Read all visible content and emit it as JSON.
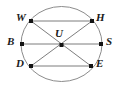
{
  "figure": {
    "type": "circle-geometry-diagram",
    "background_color": "#ffffff",
    "stroke_color": "#8c8c8c",
    "chord_color": "#6e6e6e",
    "point_color": "#141414",
    "label_color": "#1a1a1a",
    "circle": {
      "center_x": 61.5,
      "center_y": 44,
      "radius_x": 40.5,
      "radius_y": 37.5
    },
    "points": [
      {
        "id": "W",
        "label": "W",
        "x": 31,
        "y": 21,
        "label_x": 16,
        "label_y": 12,
        "on_circle": true
      },
      {
        "id": "H",
        "label": "H",
        "x": 92,
        "y": 21,
        "label_x": 96,
        "label_y": 12,
        "on_circle": true
      },
      {
        "id": "B",
        "label": "B",
        "x": 22,
        "y": 44,
        "label_x": 7,
        "label_y": 36,
        "on_circle": true
      },
      {
        "id": "U",
        "label": "U",
        "x": 61.5,
        "y": 45,
        "label_x": 55,
        "label_y": 28,
        "on_circle": false
      },
      {
        "id": "S",
        "label": "S",
        "x": 101,
        "y": 44,
        "label_x": 106,
        "label_y": 36,
        "on_circle": true
      },
      {
        "id": "D",
        "label": "D",
        "x": 31,
        "y": 66,
        "label_x": 16,
        "label_y": 58,
        "on_circle": true
      },
      {
        "id": "E",
        "label": "E",
        "x": 91,
        "y": 66,
        "label_x": 96,
        "label_y": 58,
        "on_circle": true
      }
    ],
    "segments": [
      {
        "id": "WH",
        "from": "W",
        "to": "H",
        "kind": "chord-horizontal"
      },
      {
        "id": "BS",
        "from": "B",
        "to": "S",
        "kind": "diameter-horizontal"
      },
      {
        "id": "DE",
        "from": "D",
        "to": "E",
        "kind": "chord-horizontal"
      },
      {
        "id": "WE",
        "from": "W",
        "to": "E",
        "kind": "diameter-diagonal"
      },
      {
        "id": "DH",
        "from": "D",
        "to": "H",
        "kind": "diameter-diagonal"
      }
    ]
  }
}
